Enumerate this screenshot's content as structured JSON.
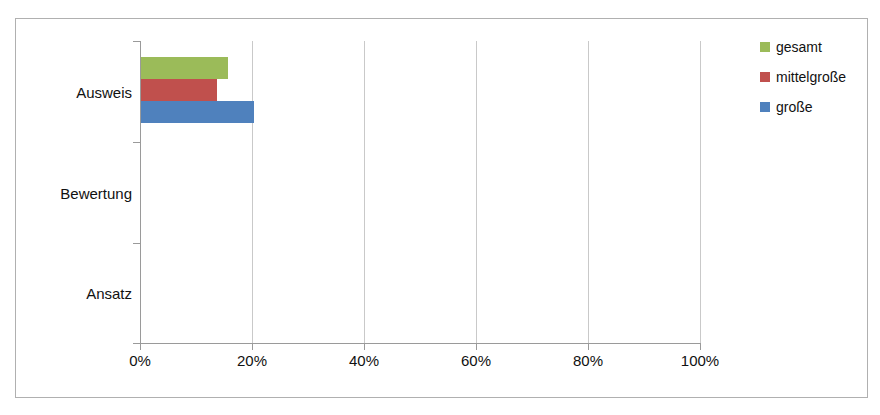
{
  "chart_data": {
    "type": "bar",
    "orientation": "horizontal",
    "title": "",
    "xlabel": "",
    "ylabel": "",
    "grid": true,
    "legend_position": "right",
    "categories": [
      "Ausweis",
      "Bewertung",
      "Ansatz"
    ],
    "xlim": [
      0,
      100
    ],
    "xticks": [
      0,
      20,
      40,
      60,
      80,
      100
    ],
    "xtick_labels": [
      "0%",
      "20%",
      "40%",
      "60%",
      "80%",
      "100%"
    ],
    "series": [
      {
        "name": "gesamt",
        "color": "#9BBB59",
        "values": [
          15.7,
          0,
          0
        ]
      },
      {
        "name": "mittelgroße",
        "color": "#C0504D",
        "values": [
          13.7,
          0,
          0
        ]
      },
      {
        "name": "große",
        "color": "#4F81BD",
        "values": [
          20.4,
          0,
          0
        ]
      }
    ]
  },
  "legend": {
    "items": [
      {
        "label": "gesamt",
        "color": "#9BBB59"
      },
      {
        "label": "mittelgroße",
        "color": "#C0504D"
      },
      {
        "label": "große",
        "color": "#4F81BD"
      }
    ]
  },
  "axis": {
    "category_labels": [
      "Ausweis",
      "Bewertung",
      "Ansatz"
    ],
    "value_labels": [
      "0%",
      "20%",
      "40%",
      "60%",
      "80%",
      "100%"
    ]
  },
  "colors": {
    "gesamt": "#9BBB59",
    "mittelgrosse": "#C0504D",
    "grosse": "#4F81BD",
    "gridline": "#c9c9c9",
    "axis": "#9a9a9a",
    "frame": "#b0b0b0",
    "background": "#ffffff"
  }
}
